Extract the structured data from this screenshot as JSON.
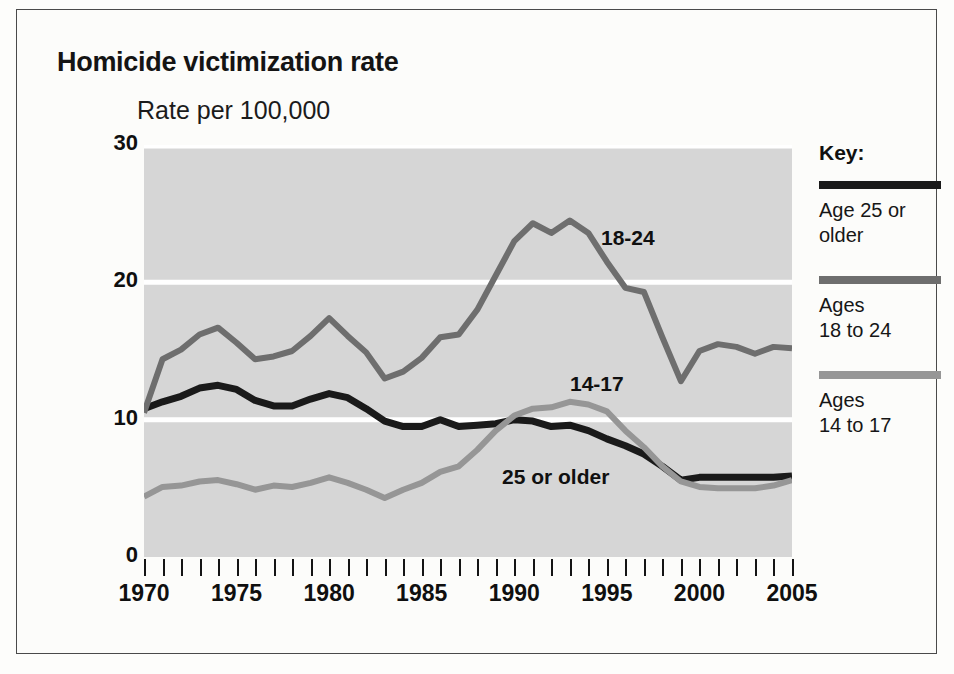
{
  "title": "Homicide victimization rate",
  "subtitle": "Rate per 100,000",
  "key": {
    "heading": "Key:",
    "entries": [
      {
        "label": "Age 25 or\nolder",
        "color": "#1a1a1a"
      },
      {
        "label": "Ages\n18 to 24",
        "color": "#6e6e6e"
      },
      {
        "label": "Ages\n14 to 17",
        "color": "#969696"
      }
    ]
  },
  "annotations": [
    {
      "name": "18-24",
      "text": "18-24"
    },
    {
      "name": "14-17",
      "text": "14-17"
    },
    {
      "name": "25-or-older",
      "text": "25 or older"
    }
  ],
  "chart_data": {
    "type": "line",
    "title": "Homicide victimization rate",
    "subtitle": "Rate per 100,000",
    "xlabel": "",
    "ylabel": "Rate per 100,000",
    "xlim": [
      1970,
      2005
    ],
    "ylim": [
      0,
      30
    ],
    "yticks": [
      0,
      10,
      20,
      30
    ],
    "ytick_labels": [
      "0",
      "10",
      "20",
      "30"
    ],
    "xticks": [
      1970,
      1975,
      1980,
      1985,
      1990,
      1995,
      2000,
      2005
    ],
    "xtick_labels": [
      "1970",
      "1975",
      "1980",
      "1985",
      "1990",
      "1995",
      "2000",
      "2005"
    ],
    "xtick_minor_step": 1,
    "grid": "horizontal-white",
    "plot_background": "#d6d6d6",
    "legend_position": "right",
    "x": [
      1970,
      1971,
      1972,
      1973,
      1974,
      1975,
      1976,
      1977,
      1978,
      1979,
      1980,
      1981,
      1982,
      1983,
      1984,
      1985,
      1986,
      1987,
      1988,
      1989,
      1990,
      1991,
      1992,
      1993,
      1994,
      1995,
      1996,
      1997,
      1998,
      1999,
      2000,
      2001,
      2002,
      2003,
      2004,
      2005
    ],
    "series": [
      {
        "name": "Age 25 or older",
        "label": "25 or older",
        "color": "#1a1a1a",
        "values": [
          10.8,
          11.3,
          11.7,
          12.3,
          12.5,
          12.2,
          11.4,
          11.0,
          11.0,
          11.5,
          11.9,
          11.6,
          10.8,
          9.9,
          9.5,
          9.5,
          10.0,
          9.5,
          9.6,
          9.7,
          10.0,
          9.9,
          9.5,
          9.6,
          9.2,
          8.6,
          8.1,
          7.5,
          6.6,
          5.6,
          5.8,
          5.8,
          5.8,
          5.8,
          5.8,
          5.9
        ]
      },
      {
        "name": "Ages 18 to 24",
        "label": "18-24",
        "color": "#6e6e6e",
        "values": [
          10.5,
          14.4,
          15.1,
          16.2,
          16.7,
          15.6,
          14.4,
          14.6,
          15.0,
          16.1,
          17.4,
          16.1,
          14.9,
          13.0,
          13.5,
          14.5,
          16.0,
          16.2,
          18.0,
          20.5,
          23.0,
          24.3,
          23.6,
          24.5,
          23.6,
          21.5,
          19.6,
          19.3,
          16.0,
          12.8,
          15.0,
          15.5,
          15.3,
          14.8,
          15.3,
          15.2
        ]
      },
      {
        "name": "Ages 14 to 17",
        "label": "14-17",
        "color": "#969696",
        "values": [
          4.4,
          5.1,
          5.2,
          5.5,
          5.6,
          5.3,
          4.9,
          5.2,
          5.1,
          5.4,
          5.8,
          5.4,
          4.9,
          4.3,
          4.9,
          5.4,
          6.2,
          6.6,
          7.8,
          9.2,
          10.3,
          10.8,
          10.9,
          11.3,
          11.1,
          10.6,
          9.2,
          8.0,
          6.6,
          5.5,
          5.1,
          5.0,
          5.0,
          5.0,
          5.2,
          5.6
        ]
      }
    ]
  }
}
